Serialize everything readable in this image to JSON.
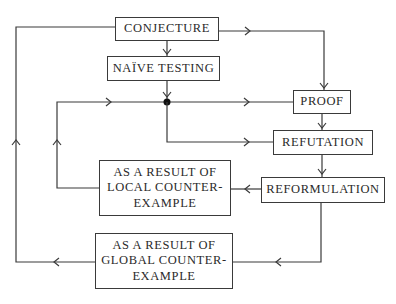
{
  "diagram": {
    "nodes": {
      "conjecture": {
        "label": "CONJECTURE"
      },
      "naive_testing": {
        "label": "NAÏVE TESTING"
      },
      "proof": {
        "label": "PROOF"
      },
      "refutation": {
        "label": "REFUTATION"
      },
      "reformulation": {
        "label": "REFORMULATION"
      },
      "local": {
        "label": "AS A RESULT OF\nLOCAL COUNTER-\nEXAMPLE"
      },
      "global": {
        "label": "AS A RESULT OF\nGLOBAL COUNTER-\nEXAMPLE"
      }
    },
    "edges": [
      {
        "from": "conjecture",
        "to": "naive_testing"
      },
      {
        "from": "conjecture",
        "to": "proof"
      },
      {
        "from": "conjecture",
        "to": "junction",
        "via": "outer-left-loop",
        "note": "from global counter-example"
      },
      {
        "from": "naive_testing",
        "to": "junction"
      },
      {
        "from": "junction",
        "to": "proof"
      },
      {
        "from": "junction",
        "to": "refutation"
      },
      {
        "from": "proof",
        "to": "refutation"
      },
      {
        "from": "refutation",
        "to": "reformulation"
      },
      {
        "from": "reformulation",
        "to": "local"
      },
      {
        "from": "reformulation",
        "to": "global"
      },
      {
        "from": "local",
        "to": "junction",
        "via": "inner-left-loop"
      },
      {
        "from": "global",
        "to": "conjecture",
        "via": "outer-left-loop"
      }
    ],
    "colors": {
      "stroke": "#3a3a3a",
      "text": "#2a2a2a",
      "background": "#ffffff"
    }
  }
}
